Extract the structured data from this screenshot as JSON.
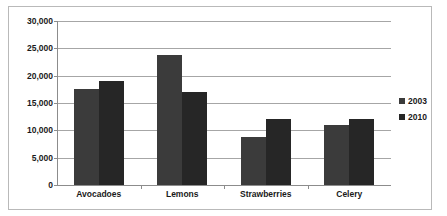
{
  "chart_data": {
    "type": "bar",
    "title": "",
    "subtitle": "",
    "xlabel": "",
    "ylabel": "",
    "categories": [
      "Avocadoes",
      "Lemons",
      "Strawberries",
      "Celery"
    ],
    "series": [
      {
        "name": "2003",
        "values": [
          17500,
          23800,
          8700,
          11000
        ],
        "color": "#3b3b3b"
      },
      {
        "name": "2010",
        "values": [
          19000,
          17000,
          12000,
          12000
        ],
        "color": "#262626"
      }
    ],
    "ylim": [
      0,
      30000
    ],
    "ytick_step": 5000,
    "ytick_labels": [
      "30,000",
      "25,000",
      "20,000",
      "15,000",
      "10,000",
      "5,000",
      "0"
    ],
    "ytick_values": [
      30000,
      25000,
      20000,
      15000,
      10000,
      5000,
      0
    ],
    "grid": true,
    "grid_axis": "y",
    "legend_position": "right",
    "legend": [
      "2003",
      "2010"
    ],
    "bar_gap_within_group": 0,
    "border": true,
    "background": "#ffffff"
  }
}
